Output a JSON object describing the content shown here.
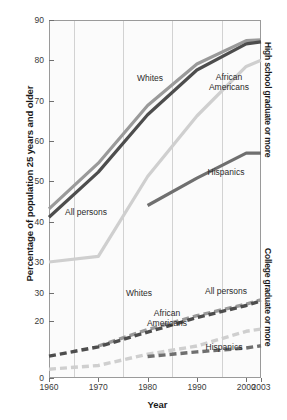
{
  "chart_data": {
    "type": "line",
    "title": "",
    "xlabel": "Year",
    "ylabel": "Percentage of population 25 years and older",
    "grid": true,
    "legend_position": "inline-annotations",
    "x": [
      1960,
      1970,
      1980,
      1990,
      2000,
      2003
    ],
    "xlim": [
      1960,
      2003
    ],
    "xticks": [
      1960,
      1970,
      1980,
      1990,
      2000,
      2003
    ],
    "gridline_years": [
      1965,
      1975,
      1985,
      1995
    ],
    "panels": [
      {
        "name": "High school graduate or more",
        "ylim": [
          30,
          90
        ],
        "yticks": [
          30,
          40,
          50,
          60,
          70,
          80,
          90
        ],
        "linestyle": "solid",
        "series": [
          {
            "name": "All persons",
            "color": "#4d4d4d",
            "values": [
              41.1,
              52.3,
              66.5,
              77.6,
              84.1,
              84.6
            ]
          },
          {
            "name": "Whites",
            "color": "#9a9a9a",
            "values": [
              43.2,
              54.5,
              68.8,
              79.1,
              84.9,
              85.1
            ]
          },
          {
            "name": "African Americans",
            "color": "#cfcfcf",
            "values": [
              30.0,
              31.4,
              51.2,
              66.2,
              78.5,
              80.0
            ]
          },
          {
            "name": "Hispanics",
            "color": "#6f6f6f",
            "values": [
              null,
              null,
              44.0,
              50.8,
              57.0,
              57.0
            ]
          }
        ]
      },
      {
        "name": "College graduate or more",
        "ylim": [
          0,
          30
        ],
        "yticks": [
          0,
          10,
          20,
          30
        ],
        "ytick_labels_shown": [
          0,
          20,
          30
        ],
        "linestyle": "dashed",
        "series": [
          {
            "name": "All persons",
            "color": "#4d4d4d",
            "values": [
              7.7,
              11.0,
              16.2,
              21.3,
              25.6,
              27.2
            ]
          },
          {
            "name": "Whites",
            "color": "#9a9a9a",
            "values": [
              null,
              11.3,
              17.1,
              22.0,
              26.1,
              27.6
            ]
          },
          {
            "name": "African Americans",
            "color": "#cfcfcf",
            "values": [
              3.1,
              4.4,
              8.4,
              11.3,
              16.5,
              17.3
            ]
          },
          {
            "name": "Hispanics",
            "color": "#6f6f6f",
            "values": [
              null,
              null,
              7.6,
              9.2,
              10.6,
              11.4
            ]
          }
        ]
      }
    ],
    "annotations": [
      {
        "text": "Whites",
        "panel": "upper",
        "x_px": 150,
        "y_px": 78
      },
      {
        "text": "All persons",
        "panel": "upper",
        "x_px": 86,
        "y_px": 212
      },
      {
        "text": "African\nAmericans",
        "panel": "upper",
        "x_px": 229,
        "y_px": 82
      },
      {
        "text": "Hispanics",
        "panel": "upper",
        "x_px": 226,
        "y_px": 172
      },
      {
        "text": "Whites",
        "panel": "lower",
        "x_px": 139,
        "y_px": 293
      },
      {
        "text": "All persons",
        "panel": "lower",
        "x_px": 226,
        "y_px": 291
      },
      {
        "text": "African\nAmericans",
        "panel": "lower",
        "x_px": 167,
        "y_px": 318
      },
      {
        "text": "Hispanics",
        "panel": "lower",
        "x_px": 224,
        "y_px": 347
      }
    ]
  },
  "axis": {
    "y_title": "Percentage of population 25 years and older",
    "x_title": "Year",
    "right_label_top": "High school graduate or more",
    "right_label_bottom": "College graduate or more",
    "y_ticks_upper": [
      "90",
      "80",
      "70",
      "60",
      "50",
      "40",
      "30"
    ],
    "y_ticks_lower": [
      "30",
      "20",
      "0"
    ],
    "x_ticks": [
      "1960",
      "1970",
      "1980",
      "1990",
      "2000",
      "2003"
    ]
  },
  "labels": {
    "whites": "Whites",
    "all_persons": "All persons",
    "african_americans_line1": "African",
    "african_americans_line2": "Americans",
    "hispanics": "Hispanics"
  },
  "colors": {
    "all_persons": "#4d4d4d",
    "whites": "#9a9a9a",
    "african_americans": "#cfcfcf",
    "hispanics": "#6f6f6f",
    "grid": "#d2d2d2",
    "axis": "#9a9a9a"
  }
}
